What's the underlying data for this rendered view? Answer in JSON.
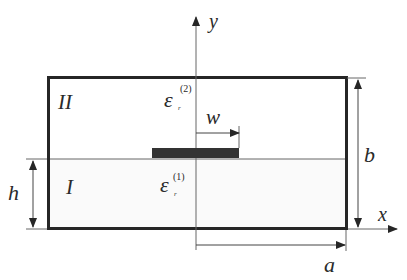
{
  "diagram": {
    "regions": {
      "upper": {
        "label": "II",
        "permittivity_base": "ε",
        "permittivity_sub": "r",
        "permittivity_sup": "(2)"
      },
      "lower": {
        "label": "I",
        "permittivity_base": "ε",
        "permittivity_sub": "r",
        "permittivity_sup": "(1)"
      }
    },
    "axes": {
      "x_label": "x",
      "y_label": "y"
    },
    "dimensions": {
      "strip_half_width": "w",
      "half_width": "a",
      "height": "b",
      "substrate_height": "h"
    },
    "colors": {
      "box_border": "#262626",
      "strip_fill": "#333333",
      "lines": "#555555",
      "substrate_fill": "#fafafa",
      "text": "#2a2a2a"
    }
  }
}
